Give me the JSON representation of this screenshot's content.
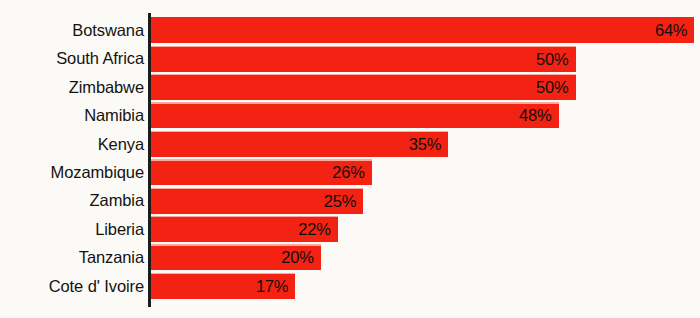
{
  "chart_data": {
    "type": "bar",
    "orientation": "horizontal",
    "title": "",
    "subtitle": "",
    "xlabel": "",
    "ylabel": "",
    "categories": [
      "Botswana",
      "South Africa",
      "Zimbabwe",
      "Namibia",
      "Kenya",
      "Mozambique",
      "Zambia",
      "Liberia",
      "Tanzania",
      "Cote d' Ivoire"
    ],
    "values": [
      64,
      50,
      50,
      48,
      35,
      26,
      25,
      22,
      20,
      17
    ],
    "value_labels": [
      "64%",
      "50%",
      "50%",
      "48%",
      "35%",
      "26%",
      "25%",
      "22%",
      "20%",
      "17%"
    ],
    "unit": "%",
    "xlim": [
      0,
      64
    ],
    "grid": false,
    "legend": null,
    "legend_position": "none",
    "annotations": [],
    "series": [
      {
        "name": "",
        "values": [
          64,
          50,
          50,
          48,
          35,
          26,
          25,
          22,
          20,
          17
        ]
      }
    ]
  },
  "style": {
    "bar_color": "#f32213",
    "background_color": "#fbfaf7",
    "axis_color": "#1b1b1b",
    "label_color": "#15130f",
    "value_label_color": "#100e0c",
    "separator_color": "#ffbeb4"
  }
}
